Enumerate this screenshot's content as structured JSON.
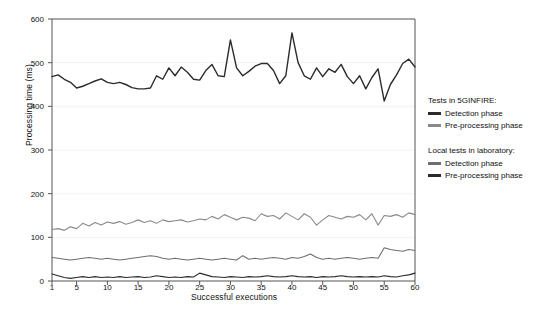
{
  "chart_data": {
    "type": "line",
    "title": "",
    "xlabel": "Successful executions",
    "ylabel": "Processing time (ms)",
    "xlim": [
      1,
      60
    ],
    "ylim": [
      0,
      600
    ],
    "yticks": [
      0,
      100,
      200,
      300,
      400,
      500,
      600
    ],
    "xticks": [
      1,
      5,
      10,
      15,
      20,
      25,
      30,
      35,
      40,
      45,
      50,
      55,
      60
    ],
    "grid": true,
    "legend_position": "right",
    "x": [
      1,
      2,
      3,
      4,
      5,
      6,
      7,
      8,
      9,
      10,
      11,
      12,
      13,
      14,
      15,
      16,
      17,
      18,
      19,
      20,
      21,
      22,
      23,
      24,
      25,
      26,
      27,
      28,
      29,
      30,
      31,
      32,
      33,
      34,
      35,
      36,
      37,
      38,
      39,
      40,
      41,
      42,
      43,
      44,
      45,
      46,
      47,
      48,
      49,
      50,
      51,
      52,
      53,
      54,
      55,
      56,
      57,
      58,
      59,
      60
    ],
    "series": [
      {
        "name": "Tests in 5GINFIRE: Detection phase",
        "group": "Tests in 5GINFIRE:",
        "phase": "Detection phase",
        "color": "#2b2b2b",
        "width": 1.4,
        "values": [
          468,
          472,
          462,
          455,
          442,
          446,
          452,
          458,
          463,
          455,
          452,
          455,
          450,
          443,
          440,
          440,
          442,
          470,
          462,
          488,
          470,
          490,
          478,
          462,
          460,
          482,
          496,
          470,
          468,
          552,
          488,
          470,
          480,
          492,
          498,
          498,
          482,
          452,
          470,
          568,
          500,
          470,
          462,
          488,
          468,
          486,
          478,
          496,
          468,
          452,
          470,
          440,
          466,
          486,
          412,
          450,
          472,
          498,
          508,
          490
        ]
      },
      {
        "name": "Tests in 5GINFIRE: Pre-processing phase",
        "group": "Tests in 5GINFIRE:",
        "phase": "Pre-processing phase",
        "color": "#8a8a8a",
        "width": 1.1,
        "values": [
          118,
          120,
          116,
          124,
          120,
          132,
          126,
          134,
          128,
          135,
          132,
          136,
          130,
          134,
          140,
          134,
          138,
          132,
          140,
          136,
          138,
          140,
          135,
          138,
          142,
          140,
          148,
          142,
          152,
          146,
          140,
          146,
          144,
          138,
          154,
          148,
          150,
          142,
          156,
          148,
          140,
          154,
          146,
          128,
          140,
          150,
          146,
          142,
          148,
          146,
          152,
          140,
          154,
          128,
          150,
          148,
          152,
          146,
          156,
          152
        ]
      },
      {
        "name": "Local tests in laboratory: Detection phase",
        "group": "Local tests in laboratory:",
        "phase": "Detection phase",
        "color": "#6e6e6e",
        "width": 1.1,
        "values": [
          54,
          52,
          50,
          48,
          50,
          52,
          54,
          52,
          50,
          52,
          50,
          48,
          50,
          52,
          54,
          56,
          58,
          56,
          52,
          50,
          52,
          50,
          48,
          50,
          52,
          50,
          48,
          50,
          52,
          50,
          48,
          58,
          50,
          52,
          50,
          52,
          54,
          52,
          50,
          54,
          52,
          56,
          62,
          54,
          50,
          52,
          50,
          52,
          54,
          52,
          50,
          52,
          54,
          52,
          76,
          72,
          70,
          68,
          72,
          70
        ]
      },
      {
        "name": "Local tests in laboratory: Pre-processing phase",
        "group": "Local tests in laboratory:",
        "phase": "Pre-processing phase",
        "color": "#2b2b2b",
        "width": 1.1,
        "values": [
          16,
          12,
          8,
          6,
          8,
          10,
          8,
          10,
          8,
          9,
          8,
          10,
          8,
          9,
          10,
          8,
          9,
          12,
          10,
          8,
          9,
          8,
          10,
          9,
          18,
          14,
          10,
          9,
          8,
          10,
          9,
          8,
          10,
          9,
          10,
          12,
          10,
          9,
          10,
          12,
          10,
          9,
          10,
          8,
          10,
          9,
          10,
          12,
          10,
          9,
          10,
          9,
          10,
          9,
          12,
          10,
          9,
          12,
          14,
          18
        ]
      }
    ]
  },
  "axes": {
    "y_title": "Processing time (ms)",
    "x_title": "Successful executions",
    "y_tick_labels": [
      "0",
      "100",
      "200",
      "300",
      "400",
      "500",
      "600"
    ],
    "x_tick_labels": [
      "1",
      "5",
      "10",
      "15",
      "20",
      "25",
      "30",
      "35",
      "40",
      "45",
      "50",
      "55",
      "60"
    ]
  },
  "legend": {
    "groups": [
      {
        "title": "Tests in 5GINFIRE:",
        "entries": [
          {
            "label": "Detection phase",
            "swatch": "sw-thick"
          },
          {
            "label": "Pre-processing phase",
            "swatch": "sw-gray"
          }
        ]
      },
      {
        "title": "Local tests in laboratory:",
        "entries": [
          {
            "label": "Detection phase",
            "swatch": "sw-mid"
          },
          {
            "label": "Pre-processing phase",
            "swatch": "sw-thick"
          }
        ]
      }
    ]
  },
  "colors": {
    "background": "#ffffff",
    "axis": "#555555",
    "grid": "#f2f2f2",
    "dark_line": "#2b2b2b",
    "gray_line": "#8a8a8a",
    "mid_line": "#6e6e6e"
  }
}
